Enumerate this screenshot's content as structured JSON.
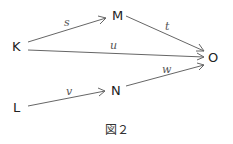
{
  "diagram": {
    "caption": "図２",
    "nodes": [
      {
        "id": "K",
        "label": "K",
        "x": 17,
        "y": 46
      },
      {
        "id": "M",
        "label": "M",
        "x": 118,
        "y": 15
      },
      {
        "id": "O",
        "label": "O",
        "x": 213,
        "y": 57
      },
      {
        "id": "L",
        "label": "L",
        "x": 17,
        "y": 107
      },
      {
        "id": "N",
        "label": "N",
        "x": 117,
        "y": 90
      }
    ],
    "edges": [
      {
        "from": "K",
        "to": "M",
        "label": "s"
      },
      {
        "from": "M",
        "to": "O",
        "label": "t"
      },
      {
        "from": "K",
        "to": "O",
        "label": "u"
      },
      {
        "from": "L",
        "to": "N",
        "label": "v"
      },
      {
        "from": "N",
        "to": "O",
        "label": "w"
      }
    ]
  }
}
